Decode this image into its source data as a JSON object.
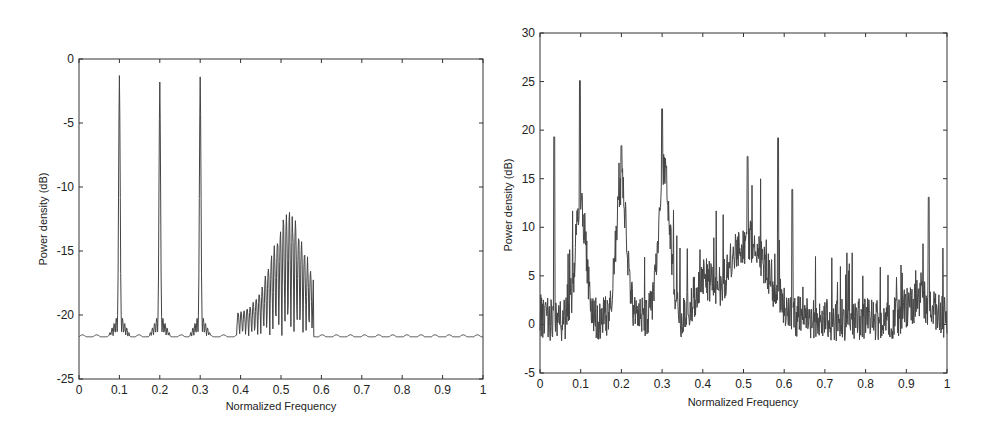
{
  "chart_data": [
    {
      "type": "line",
      "title": "",
      "xlabel": "Normalized Frequency",
      "ylabel": "Power density (dB)",
      "xlim": [
        0,
        1
      ],
      "ylim": [
        -25,
        0
      ],
      "xticks": [
        "0",
        "0.1",
        "0.2",
        "0.3",
        "0.4",
        "0.5",
        "0.6",
        "0.7",
        "0.8",
        "0.9",
        "1"
      ],
      "yticks": [
        "0",
        "-5",
        "-10",
        "-15",
        "-20",
        "-25"
      ],
      "grid": false,
      "legend": null,
      "noise_floor_db": -21.7,
      "peaks": [
        {
          "x": 0.1,
          "y": -1.3
        },
        {
          "x": 0.2,
          "y": -1.8
        },
        {
          "x": 0.3,
          "y": -1.4
        }
      ],
      "band": {
        "x_start": 0.39,
        "x_end": 0.58,
        "max_y": -11.8,
        "max_x": 0.52
      },
      "line_color": "#444444"
    },
    {
      "type": "line",
      "title": "",
      "xlabel": "Normalized Frequency",
      "ylabel": "Power density (dB)",
      "xlim": [
        0,
        1
      ],
      "ylim": [
        -5,
        30
      ],
      "xticks": [
        "0",
        "0.1",
        "0.2",
        "0.3",
        "0.4",
        "0.5",
        "0.6",
        "0.7",
        "0.8",
        "0.9",
        "1"
      ],
      "yticks": [
        "30",
        "25",
        "20",
        "15",
        "10",
        "5",
        "0",
        "-5"
      ],
      "grid": false,
      "legend": null,
      "noise_floor_db": 0.5,
      "peaks": [
        {
          "x": 0.035,
          "y": 19.3
        },
        {
          "x": 0.098,
          "y": 25.1
        },
        {
          "x": 0.2,
          "y": 18.4
        },
        {
          "x": 0.3,
          "y": 22.2
        },
        {
          "x": 0.51,
          "y": 17.3
        },
        {
          "x": 0.585,
          "y": 19.2
        },
        {
          "x": 0.62,
          "y": 13.9
        },
        {
          "x": 0.955,
          "y": 13.1
        }
      ],
      "band": {
        "x_start": 0.43,
        "x_end": 0.63,
        "max_y": 14,
        "max_x": 0.51
      },
      "min_y": -4,
      "line_color": "#444444"
    }
  ]
}
